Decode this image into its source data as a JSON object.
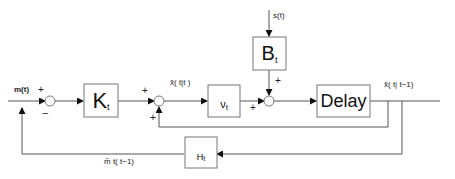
{
  "diagram": {
    "type": "block-diagram",
    "blocks": {
      "K": {
        "main": "K",
        "sub": "t"
      },
      "nu": {
        "main": "ν",
        "sub": "t"
      },
      "B": {
        "main": "B",
        "sub": "t"
      },
      "delay": {
        "main": "Delay"
      },
      "H": {
        "main": "H",
        "sub": "t"
      }
    },
    "signals": {
      "input": "m(t)",
      "disturbance": "s(t)",
      "estimate": "x̂( t|t )",
      "prediction": "x̂( t| t−1)",
      "feedback": "m̂ t( t−1)"
    },
    "signs": {
      "sum1_top": "+",
      "sum1_bottom": "−",
      "sum2_top": "+",
      "sum2_bottom": "+",
      "sum3_left": "+",
      "sum3_top": "+"
    },
    "colors": {
      "line": "#555555",
      "box": "#777777"
    }
  }
}
